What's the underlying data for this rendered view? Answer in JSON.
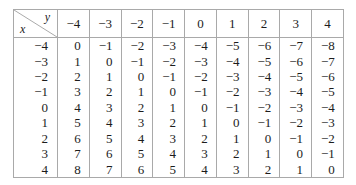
{
  "table": {
    "corner": {
      "column_variable_label": "y",
      "row_variable_label": "x"
    },
    "column_headers": [
      "−4",
      "−3",
      "−2",
      "−1",
      "0",
      "1",
      "2",
      "3",
      "4"
    ],
    "row_headers": [
      "−4",
      "−3",
      "−2",
      "−1",
      "0",
      "1",
      "2",
      "3",
      "4"
    ],
    "rows": [
      [
        "0",
        "−1",
        "−2",
        "−3",
        "−4",
        "−5",
        "−6",
        "−7",
        "−8"
      ],
      [
        "1",
        "0",
        "−1",
        "−2",
        "−3",
        "−4",
        "−5",
        "−6",
        "−7"
      ],
      [
        "2",
        "1",
        "0",
        "−1",
        "−2",
        "−3",
        "−4",
        "−5",
        "−6"
      ],
      [
        "3",
        "2",
        "1",
        "0",
        "−1",
        "−2",
        "−3",
        "−4",
        "−5"
      ],
      [
        "4",
        "3",
        "2",
        "1",
        "0",
        "−1",
        "−2",
        "−3",
        "−4"
      ],
      [
        "5",
        "4",
        "3",
        "2",
        "1",
        "0",
        "−1",
        "−2",
        "−3"
      ],
      [
        "6",
        "5",
        "4",
        "3",
        "2",
        "1",
        "0",
        "−1",
        "−2"
      ],
      [
        "7",
        "6",
        "5",
        "4",
        "3",
        "2",
        "1",
        "0",
        "−1"
      ],
      [
        "8",
        "7",
        "6",
        "5",
        "4",
        "3",
        "2",
        "1",
        "0"
      ]
    ],
    "colors": {
      "border": "#a9a9a9",
      "text": "#1c1c1c",
      "background": "#ffffff"
    }
  }
}
